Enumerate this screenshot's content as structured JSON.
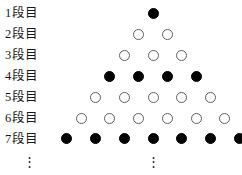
{
  "figure": {
    "background_color": "#ffffff",
    "filled_color": "#000000",
    "open_fill_color": "#ffffff",
    "open_stroke_color": "#5e5e5e",
    "text_color": "#171717",
    "left_continuation": "⋮",
    "center_continuation": "⋮",
    "geometry": {
      "apex_center_x": 153,
      "horizontal_spacing": 28.7,
      "vertical_spacing": 20.9,
      "first_row_y": 8,
      "dot_diameter": 11
    },
    "rows": [
      {
        "index": 1,
        "label": "1段目",
        "count": 1,
        "style": "filled"
      },
      {
        "index": 2,
        "label": "2段目",
        "count": 2,
        "style": "open"
      },
      {
        "index": 3,
        "label": "3段目",
        "count": 3,
        "style": "open"
      },
      {
        "index": 4,
        "label": "4段目",
        "count": 4,
        "style": "filled"
      },
      {
        "index": 5,
        "label": "5段目",
        "count": 5,
        "style": "open"
      },
      {
        "index": 6,
        "label": "6段目",
        "count": 6,
        "style": "open"
      },
      {
        "index": 7,
        "label": "7段目",
        "count": 7,
        "style": "filled"
      }
    ]
  }
}
